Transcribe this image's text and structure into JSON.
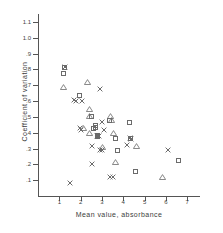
{
  "chart_data": {
    "type": "scatter",
    "title": "",
    "xlabel": "Mean  value,  absorbance",
    "ylabel": "Coefficient of variation",
    "xlim": [
      0,
      7.6
    ],
    "ylim": [
      0,
      1.15
    ],
    "xticks": [
      1,
      2,
      3,
      4,
      5,
      6,
      7
    ],
    "xticklabels": [
      "1",
      "2",
      "3",
      "4",
      "5",
      "6",
      "7"
    ],
    "yticks": [
      0.1,
      0.2,
      0.3,
      0.4,
      0.5,
      0.6,
      0.7,
      0.8,
      0.9,
      1.0,
      1.1
    ],
    "yticklabels": [
      ".1",
      ".2",
      ".3",
      ".4",
      ".5",
      ".6",
      ".7",
      ".8",
      ".9",
      "1.0",
      "1.1"
    ],
    "grid": false,
    "legend": "none",
    "marker_color": "#6b6b6b",
    "series": [
      {
        "name": "square",
        "marker": "square",
        "points": [
          [
            1.22,
            0.815
          ],
          [
            1.18,
            0.775
          ],
          [
            1.93,
            0.635
          ],
          [
            2.52,
            0.505
          ],
          [
            2.72,
            0.445
          ],
          [
            2.62,
            0.425
          ],
          [
            2.78,
            0.385
          ],
          [
            2.8,
            0.375
          ],
          [
            3.34,
            0.475
          ],
          [
            4.28,
            0.465
          ],
          [
            3.62,
            0.365
          ],
          [
            3.72,
            0.285
          ],
          [
            4.32,
            0.365
          ],
          [
            4.58,
            0.155
          ],
          [
            6.6,
            0.225
          ],
          [
            2.7,
            0.435
          ]
        ]
      },
      {
        "name": "triangle",
        "marker": "triangle",
        "points": [
          [
            1.17,
            0.675
          ],
          [
            2.28,
            0.705
          ],
          [
            2.38,
            0.535
          ],
          [
            2.38,
            0.495
          ],
          [
            2.12,
            0.415
          ],
          [
            2.38,
            0.385
          ],
          [
            3.4,
            0.495
          ],
          [
            3.42,
            0.465
          ],
          [
            3.5,
            0.385
          ],
          [
            3.62,
            0.205
          ],
          [
            4.58,
            0.305
          ],
          [
            5.82,
            0.105
          ],
          [
            2.98,
            0.295
          ]
        ]
      },
      {
        "name": "cross",
        "marker": "cross",
        "points": [
          [
            1.26,
            0.818
          ],
          [
            1.7,
            0.605
          ],
          [
            1.8,
            0.6
          ],
          [
            2.08,
            0.6
          ],
          [
            2.92,
            0.675
          ],
          [
            3.02,
            0.465
          ],
          [
            1.98,
            0.43
          ],
          [
            2.02,
            0.418
          ],
          [
            3.1,
            0.42
          ],
          [
            2.78,
            0.382
          ],
          [
            2.86,
            0.378
          ],
          [
            2.52,
            0.315
          ],
          [
            2.92,
            0.292
          ],
          [
            3.0,
            0.29
          ],
          [
            2.52,
            0.202
          ],
          [
            4.32,
            0.368
          ],
          [
            4.36,
            0.362
          ],
          [
            4.18,
            0.322
          ],
          [
            6.08,
            0.292
          ],
          [
            3.4,
            0.118
          ],
          [
            3.5,
            0.118
          ],
          [
            1.52,
            0.082
          ]
        ]
      }
    ]
  }
}
